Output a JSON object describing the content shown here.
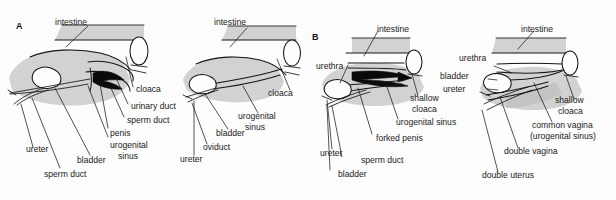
{
  "figure": {
    "type": "anatomical-diagram",
    "background_color": "#fdfdfd",
    "organ_fill_color": "#d2d2d2",
    "outline_color": "#151515",
    "text_color": "#1a1a1a"
  },
  "panels": [
    {
      "id": "A",
      "letter": "A",
      "diagrams": [
        {
          "id": "a-male",
          "sex": "male",
          "labels": [
            {
              "text": "intestine"
            },
            {
              "text": "cloaca"
            },
            {
              "text": "urinary duct"
            },
            {
              "text": "sperm duct"
            },
            {
              "text": "penis"
            },
            {
              "text": "urogenital"
            },
            {
              "text": "sinus"
            },
            {
              "text": "bladder"
            },
            {
              "text": "sperm duct"
            },
            {
              "text": "ureter"
            }
          ]
        },
        {
          "id": "a-female",
          "sex": "female",
          "labels": [
            {
              "text": "intestine"
            },
            {
              "text": "cloaca"
            },
            {
              "text": "urogenital"
            },
            {
              "text": "sinus"
            },
            {
              "text": "bladder"
            },
            {
              "text": "oviduct"
            },
            {
              "text": "ureter"
            }
          ]
        }
      ]
    },
    {
      "id": "B",
      "letter": "B",
      "diagrams": [
        {
          "id": "b-male",
          "sex": "male",
          "labels": [
            {
              "text": "intestine"
            },
            {
              "text": "urethra"
            },
            {
              "text": "shallow"
            },
            {
              "text": "cloaca"
            },
            {
              "text": "urogenital sinus"
            },
            {
              "text": "forked penis"
            },
            {
              "text": "sperm duct"
            },
            {
              "text": "bladder"
            },
            {
              "text": "ureter"
            }
          ]
        },
        {
          "id": "b-female",
          "sex": "female",
          "labels": [
            {
              "text": "intestine"
            },
            {
              "text": "urethra"
            },
            {
              "text": "bladder"
            },
            {
              "text": "ureter"
            },
            {
              "text": "shallow"
            },
            {
              "text": "cloaca"
            },
            {
              "text": "common vagina"
            },
            {
              "text": "(urogenital sinus)"
            },
            {
              "text": "double vagina"
            },
            {
              "text": "double uterus"
            }
          ]
        }
      ]
    }
  ],
  "labels": {
    "panel_a_letter": "A",
    "panel_b_letter": "B",
    "a_male_intestine": "intestine",
    "a_male_cloaca": "cloaca",
    "a_male_urinary_duct": "urinary duct",
    "a_male_sperm_duct_upper": "sperm duct",
    "a_male_penis": "penis",
    "a_male_urogenital": "urogenital",
    "a_male_sinus": "sinus",
    "a_male_bladder": "bladder",
    "a_male_sperm_duct_lower": "sperm duct",
    "a_male_ureter": "ureter",
    "a_female_intestine": "intestine",
    "a_female_cloaca": "cloaca",
    "a_female_urogenital": "urogenital",
    "a_female_sinus": "sinus",
    "a_female_bladder": "bladder",
    "a_female_oviduct": "oviduct",
    "a_female_ureter": "ureter",
    "b_male_intestine": "intestine",
    "b_male_urethra": "urethra",
    "b_male_shallow": "shallow",
    "b_male_cloaca": "cloaca",
    "b_male_urogenital_sinus": "urogenital sinus",
    "b_male_forked_penis": "forked penis",
    "b_male_sperm_duct": "sperm duct",
    "b_male_bladder": "bladder",
    "b_male_ureter": "ureter",
    "b_female_intestine": "intestine",
    "b_female_urethra": "urethra",
    "b_female_bladder": "bladder",
    "b_female_ureter": "ureter",
    "b_female_shallow": "shallow",
    "b_female_cloaca": "cloaca",
    "b_female_common_vagina": "common vagina",
    "b_female_urogenital_sinus_paren": "(urogenital sinus)",
    "b_female_double_vagina": "double vagina",
    "b_female_double_uterus": "double uterus"
  }
}
